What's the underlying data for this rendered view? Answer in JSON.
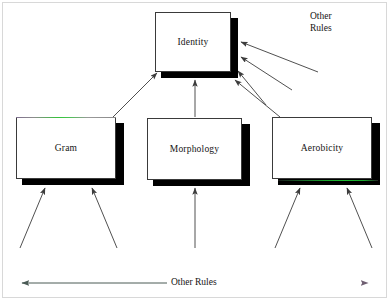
{
  "diagram": {
    "title_nodes": {
      "identity": "Identity",
      "gram": "Gram",
      "morphology": "Morphology",
      "aerobicity": "Aerobicity"
    },
    "annotations": {
      "top_right_line1": "Other",
      "top_right_line2": "Rules",
      "bottom_axis_label": "Other  Rules"
    },
    "colors": {
      "box_border": "#3a3a3a",
      "box_fill": "#ffffff",
      "shadow": "#000000",
      "arrow": "#3c3c3c",
      "text": "#141414",
      "fringe_green": "#35c23a",
      "fringe_magenta": "#e07ad0",
      "page_frame": "#d8d8d8"
    },
    "nodes": [
      {
        "id": "identity",
        "label": "Identity",
        "x": 155,
        "y": 12,
        "w": 76,
        "h": 60
      },
      {
        "id": "gram",
        "label": "Gram",
        "x": 16,
        "y": 117,
        "w": 100,
        "h": 62
      },
      {
        "id": "morphology",
        "label": "Morphology",
        "x": 147,
        "y": 118,
        "w": 95,
        "h": 62
      },
      {
        "id": "aerobicity",
        "label": "Aerobicity",
        "x": 272,
        "y": 117,
        "w": 100,
        "h": 62
      }
    ],
    "edges": [
      {
        "from": "gram",
        "to": "identity",
        "kind": "up-right"
      },
      {
        "from": "morphology",
        "to": "identity",
        "kind": "up"
      },
      {
        "from": "aerobicity",
        "to": "identity",
        "kind": "up-left"
      },
      {
        "from": "other-rules",
        "to": "identity",
        "kind": "incoming-right-1"
      },
      {
        "from": "other-rules",
        "to": "identity",
        "kind": "incoming-right-2"
      },
      {
        "from": "other-rules",
        "to": "identity",
        "kind": "incoming-right-3"
      },
      {
        "from": "other-rules",
        "to": "gram",
        "kind": "incoming-below-left"
      },
      {
        "from": "other-rules",
        "to": "gram",
        "kind": "incoming-below-right"
      },
      {
        "from": "other-rules",
        "to": "morphology",
        "kind": "incoming-below"
      },
      {
        "from": "other-rules",
        "to": "aerobicity",
        "kind": "incoming-below-left"
      },
      {
        "from": "other-rules",
        "to": "aerobicity",
        "kind": "incoming-below-right"
      }
    ]
  }
}
